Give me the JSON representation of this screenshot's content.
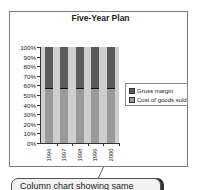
{
  "chart_data": {
    "type": "bar",
    "stacked": "percent",
    "title": "Five-Year Plan",
    "xlabel": "",
    "ylabel": "",
    "categories": [
      "1996",
      "1997",
      "1998",
      "1999",
      "2000"
    ],
    "series": [
      {
        "name": "Cost of goods sold",
        "values": [
          57,
          57,
          57,
          57,
          57
        ],
        "color": "#9a9a9a"
      },
      {
        "name": "Gross margin",
        "values": [
          43,
          43,
          43,
          43,
          43
        ],
        "color": "#5a5a5a"
      }
    ],
    "ylim": [
      0,
      100
    ],
    "yticks": [
      "0%",
      "10%",
      "20%",
      "30%",
      "40%",
      "50%",
      "60%",
      "70%",
      "80%",
      "90%",
      "100%"
    ],
    "legend": {
      "position": "right",
      "entries": [
        "Gross margin",
        "Cost of goods sold"
      ]
    },
    "grid": false,
    "plot_background": "#cfcfcf"
  },
  "callout": {
    "text": "Column chart showing same"
  }
}
